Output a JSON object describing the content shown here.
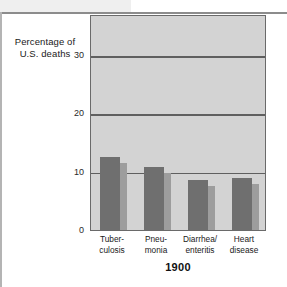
{
  "chart_data": {
    "type": "bar",
    "title": "",
    "subtitle": "",
    "period_label": "1900",
    "ylabel_line1": "Percentage of",
    "ylabel_line2": "U.S. deaths",
    "xlabel": "",
    "ylim": [
      0,
      37
    ],
    "yticks": [
      {
        "value": 0,
        "label": "0"
      },
      {
        "value": 10,
        "label": "10"
      },
      {
        "value": 20,
        "label": "20"
      },
      {
        "value": 30,
        "label": "30"
      }
    ],
    "gridlines": [
      10,
      20,
      30
    ],
    "grid": true,
    "legend": "none",
    "categories": [
      "Tuber-culosis",
      "Pneu-monia",
      "Diarrhea/enteritis",
      "Heart disease"
    ],
    "category_lines": [
      [
        "Tuber-",
        "culosis"
      ],
      [
        "Pneu-",
        "monia"
      ],
      [
        "Diarrhea/",
        "enteritis"
      ],
      [
        "Heart",
        "disease"
      ]
    ],
    "values": [
      12.5,
      10.8,
      8.6,
      8.9
    ],
    "colors": {
      "bar_face": "#6f6f6f",
      "bar_shadow": "#9d9d9d",
      "plot_background": "#d3d3d3",
      "gridline": "#5f5f5f",
      "plot_border": "#6a6a6a",
      "page_background": "#ffffff",
      "band": "#efefef",
      "rule": "#8c8c8c",
      "text": "#1a1a1a"
    }
  }
}
